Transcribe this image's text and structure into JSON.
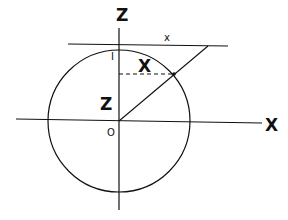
{
  "diagram": {
    "labels": {
      "z_axis": "Z",
      "x_axis": "X",
      "origin": "O",
      "unit_tick": "I",
      "tangent_x": "x",
      "segment_x": "X",
      "segment_z": "Z"
    },
    "geometry": {
      "circle": {
        "cx": 119,
        "cy": 121,
        "r": 71
      },
      "z_axis": {
        "x": 119,
        "y1": 28,
        "y2": 210
      },
      "x_axis": {
        "x1": 16,
        "y1": 119,
        "x2": 262,
        "y2": 123
      },
      "tangent_line": {
        "x1": 68,
        "y1": 44,
        "x2": 228,
        "y2": 46
      },
      "projection_line": {
        "x1": 119,
        "y1": 121,
        "x2": 208,
        "y2": 46
      },
      "dashed_line": {
        "x1": 119,
        "y1": 74,
        "x2": 174,
        "y2": 74
      },
      "intersection_point": {
        "x": 174,
        "y": 74
      }
    },
    "colors": {
      "stroke": "#111111",
      "background": "#ffffff"
    }
  }
}
